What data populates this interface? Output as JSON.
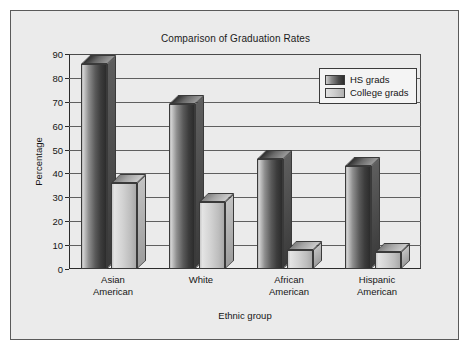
{
  "figure": {
    "title": "Comparison of Graduation Rates",
    "background_color": "#ebebeb",
    "border_color": "#5a5a5a"
  },
  "legend": {
    "position": "top-right",
    "entries": [
      {
        "label": "HS grads",
        "swatch": "dark-gradient-swatch"
      },
      {
        "label": "College grads",
        "swatch": "light-gradient-swatch"
      }
    ]
  },
  "chart_data": {
    "type": "bar",
    "title": "Comparison of Graduation Rates",
    "xlabel": "Ethnic group",
    "ylabel": "Percentage",
    "ylim": [
      0,
      90
    ],
    "yticks": [
      0,
      10,
      20,
      30,
      40,
      50,
      60,
      70,
      80,
      90
    ],
    "ytick_labels": [
      "0",
      "10",
      "20",
      "30",
      "40",
      "50",
      "60",
      "70",
      "80",
      "90"
    ],
    "grid": true,
    "legend_position": "top-right",
    "categories": [
      "Asian\nAmerican",
      "White",
      "African\nAmerican",
      "Hispanic\nAmerican"
    ],
    "category_lines": [
      [
        "Asian",
        "American"
      ],
      [
        "White",
        ""
      ],
      [
        "African",
        "American"
      ],
      [
        "Hispanic",
        "American"
      ]
    ],
    "series": [
      {
        "name": "HS grads",
        "values": [
          86,
          69,
          46,
          43
        ],
        "color": "#4a4a4a"
      },
      {
        "name": "College grads",
        "values": [
          36,
          28,
          8,
          7
        ],
        "color": "#cccccc"
      }
    ]
  }
}
